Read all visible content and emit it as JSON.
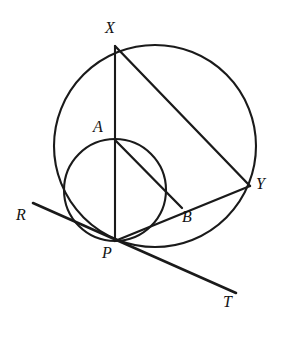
{
  "figure": {
    "stroke_color": "#1a1a1a",
    "label_color": "#131313",
    "background_color": "#ffffff",
    "labels": [
      {
        "id": "X",
        "text": "X",
        "x": 105,
        "y": 20
      },
      {
        "id": "A",
        "text": "A",
        "x": 93,
        "y": 119
      },
      {
        "id": "Y",
        "text": "Y",
        "x": 256,
        "y": 176
      },
      {
        "id": "B",
        "text": "B",
        "x": 182,
        "y": 209
      },
      {
        "id": "R",
        "text": "R",
        "x": 16,
        "y": 207
      },
      {
        "id": "P",
        "text": "P",
        "x": 102,
        "y": 245
      },
      {
        "id": "T",
        "text": "T",
        "x": 223,
        "y": 294
      }
    ],
    "shapes": {
      "big_circle": {
        "cx": 155,
        "cy": 146,
        "r": 101
      },
      "small_circle": {
        "cx": 115,
        "cy": 190,
        "r": 51
      },
      "segments": [
        {
          "id": "XP",
          "x1": 115,
          "y1": 46,
          "x2": 115,
          "y2": 241
        },
        {
          "id": "XY",
          "x1": 115,
          "y1": 46,
          "x2": 250,
          "y2": 186
        },
        {
          "id": "PY",
          "x1": 115,
          "y1": 241,
          "x2": 250,
          "y2": 186
        },
        {
          "id": "AB",
          "x1": 115,
          "y1": 140,
          "x2": 182,
          "y2": 208
        },
        {
          "id": "tangent",
          "x1": 33,
          "y1": 203,
          "x2": 236,
          "y2": 293
        }
      ]
    },
    "points": {
      "X": {
        "x": 115,
        "y": 46
      },
      "A": {
        "x": 115,
        "y": 140
      },
      "Y": {
        "x": 250,
        "y": 186
      },
      "B": {
        "x": 182,
        "y": 208
      },
      "P": {
        "x": 115,
        "y": 241
      }
    }
  }
}
